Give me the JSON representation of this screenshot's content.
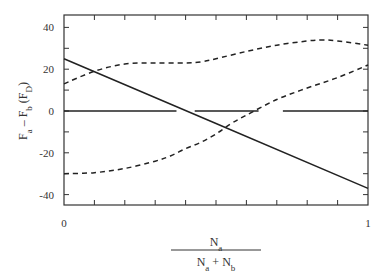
{
  "chart_data": {
    "type": "line",
    "title": "",
    "xlabel": "N_a / (N_a + N_b)",
    "xlabel_parts": {
      "numerator": "N",
      "numerator_sub": "a",
      "denominator": [
        "N",
        "a",
        " + N",
        "b"
      ]
    },
    "ylabel": "F_a - F_b (F_D)",
    "xlim": [
      0,
      1
    ],
    "ylim": [
      -44,
      44
    ],
    "grid": false,
    "legend": null,
    "x_tick_labels": [
      "0",
      "1"
    ],
    "x_minor_ticks": [
      0.1,
      0.2,
      0.3,
      0.4,
      0.5,
      0.6,
      0.7,
      0.8,
      0.9
    ],
    "y_tick_labels": [
      "40",
      "20",
      "0",
      "-20",
      "-40"
    ],
    "y_ticks": [
      40,
      30,
      20,
      10,
      0,
      -10,
      -20,
      -30,
      -40
    ],
    "series": [
      {
        "name": "solid-linear",
        "style": "solid",
        "x": [
          0,
          1
        ],
        "y": [
          25,
          -37
        ]
      },
      {
        "name": "upper-dashed",
        "style": "dashed",
        "x": [
          0,
          0.1,
          0.2,
          0.3,
          0.4,
          0.45,
          0.5,
          0.6,
          0.7,
          0.8,
          0.85,
          0.9,
          1.0
        ],
        "y": [
          13,
          19,
          22.5,
          23,
          23,
          23.5,
          25,
          28.5,
          31.5,
          33.5,
          34,
          33.5,
          31.5
        ]
      },
      {
        "name": "lower-dashed",
        "style": "dashed",
        "x": [
          0,
          0.1,
          0.2,
          0.3,
          0.35,
          0.4,
          0.45,
          0.5,
          0.55,
          0.6,
          0.7,
          0.8,
          0.9,
          1.0
        ],
        "y": [
          -30,
          -29.5,
          -27.5,
          -24,
          -21.5,
          -18,
          -15,
          -11,
          -6,
          -2,
          5.5,
          11,
          16,
          22
        ]
      },
      {
        "name": "zero-reference",
        "style": "solid",
        "x": [
          0,
          1
        ],
        "y": [
          0,
          0
        ],
        "gaps_x": [
          [
            0.37,
            0.43
          ],
          [
            0.64,
            0.72
          ]
        ]
      }
    ]
  }
}
